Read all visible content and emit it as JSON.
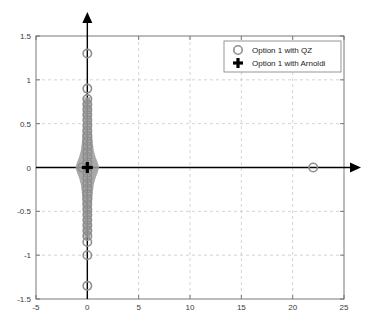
{
  "chart_data": {
    "type": "scatter",
    "title": "",
    "xlabel": "",
    "ylabel": "",
    "xlim": [
      -5,
      25
    ],
    "ylim": [
      -1.5,
      1.5
    ],
    "xticks": [
      -5,
      0,
      5,
      10,
      15,
      20,
      25
    ],
    "yticks": [
      -1.5,
      -1,
      -0.5,
      0,
      0.5,
      1,
      1.5
    ],
    "xtick_labels": [
      "-5",
      "0",
      "5",
      "10",
      "15",
      "20",
      "25"
    ],
    "ytick_labels": [
      "-1.5",
      "-1",
      "-0.5",
      "0",
      "0.5",
      "1",
      "1.5"
    ],
    "grid": true,
    "grid_style": "dashed",
    "legend_position": "upper right",
    "series": [
      {
        "name": "Option 1 with QZ",
        "marker": "circle-open",
        "color": "#8e8e8e",
        "points": [
          [
            0.0,
            1.3
          ],
          [
            0.0,
            0.9
          ],
          [
            0.0,
            0.78
          ],
          [
            0.0,
            0.72
          ],
          [
            0.0,
            0.66
          ],
          [
            0.0,
            0.6
          ],
          [
            0.0,
            0.54
          ],
          [
            0.0,
            0.48
          ],
          [
            0.0,
            0.42
          ],
          [
            0.0,
            0.36
          ],
          [
            0.0,
            0.3
          ],
          [
            0.0,
            0.24
          ],
          [
            0.0,
            0.18
          ],
          [
            0.0,
            0.12
          ],
          [
            0.0,
            0.06
          ],
          [
            0.0,
            0.0
          ],
          [
            0.0,
            -0.06
          ],
          [
            0.0,
            -0.12
          ],
          [
            0.0,
            -0.18
          ],
          [
            0.0,
            -0.24
          ],
          [
            0.0,
            -0.3
          ],
          [
            0.0,
            -0.36
          ],
          [
            0.0,
            -0.42
          ],
          [
            0.0,
            -0.48
          ],
          [
            0.0,
            -0.54
          ],
          [
            0.0,
            -0.6
          ],
          [
            0.0,
            -0.66
          ],
          [
            0.0,
            -0.72
          ],
          [
            0.0,
            -0.78
          ],
          [
            0.0,
            -0.85
          ],
          [
            0.0,
            -1.0
          ],
          [
            0.0,
            -1.35
          ],
          [
            -0.5,
            0.0
          ],
          [
            22.0,
            0.0
          ]
        ]
      },
      {
        "name": "Option 1 with Arnoldi",
        "marker": "plus",
        "color": "#000000",
        "points": [
          [
            0.0,
            0.0
          ]
        ]
      }
    ],
    "annotations": [
      "dense vertical cluster of QZ eigenvalues along the imaginary axis between -0.8 and 0.8",
      "isolated QZ eigenvalue near x = 22, y = 0",
      "Arnoldi eigenvalues collapse into a single cluster at the origin"
    ]
  },
  "legend": {
    "entries": [
      {
        "label": "Option 1 with QZ",
        "marker": "circle-open"
      },
      {
        "label": "Option 1 with Arnoldi",
        "marker": "plus"
      }
    ]
  },
  "axes": {
    "x_arrow": "right-arrow-icon",
    "y_arrow": "up-arrow-icon"
  }
}
